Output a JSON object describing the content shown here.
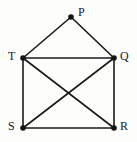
{
  "figure": {
    "width": 137,
    "height": 142,
    "background_color": "#fdfdfc",
    "stroke_color": "#1a1a1a",
    "vertex_color": "#141414"
  },
  "chart_data": {
    "type": "diagram",
    "title": "",
    "graph_kind": "undirected-graph",
    "vertex_count": 5,
    "edge_count": 8,
    "vertices": [
      {
        "id": "P",
        "label": "P",
        "x": 71,
        "y": 17,
        "label_x": 78,
        "label_y": 6,
        "label_side": "right"
      },
      {
        "id": "T",
        "label": "T",
        "x": 23,
        "y": 58,
        "label_x": 8,
        "label_y": 50,
        "label_side": "left"
      },
      {
        "id": "Q",
        "label": "Q",
        "x": 114,
        "y": 58,
        "label_x": 120,
        "label_y": 50,
        "label_side": "right"
      },
      {
        "id": "S",
        "label": "S",
        "x": 23,
        "y": 128,
        "label_x": 8,
        "label_y": 120,
        "label_side": "left"
      },
      {
        "id": "R",
        "label": "R",
        "x": 114,
        "y": 128,
        "label_x": 120,
        "label_y": 120,
        "label_side": "right"
      }
    ],
    "edges": [
      {
        "from": "P",
        "to": "T"
      },
      {
        "from": "P",
        "to": "Q"
      },
      {
        "from": "T",
        "to": "Q"
      },
      {
        "from": "T",
        "to": "S"
      },
      {
        "from": "T",
        "to": "R"
      },
      {
        "from": "Q",
        "to": "S"
      },
      {
        "from": "Q",
        "to": "R"
      },
      {
        "from": "S",
        "to": "R"
      }
    ],
    "vertex_radius": 2.8,
    "edge_width": 1.6
  }
}
